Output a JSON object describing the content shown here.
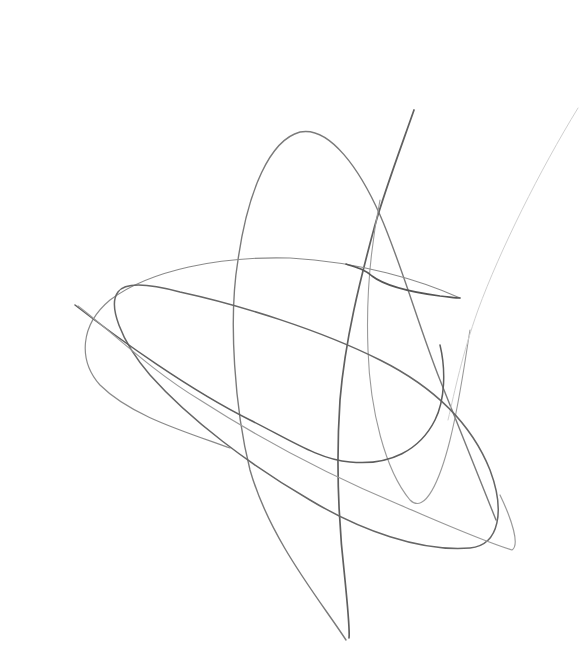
{
  "image": {
    "subject": "Abstract pencil scribble of overlapping loops and curves on white paper",
    "background_color": "#ffffff",
    "stroke_colors": {
      "dark": "#5a5a5a",
      "medium": "#7a7a7a",
      "light": "#a8a8a8",
      "faint": "#d2d2d2"
    }
  }
}
